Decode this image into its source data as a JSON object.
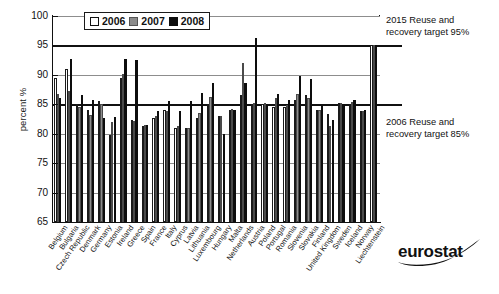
{
  "chart_data": {
    "type": "bar",
    "title": "",
    "xlabel": "",
    "ylabel": "percent %",
    "ylim": [
      65,
      100
    ],
    "yticks": [
      65,
      70,
      75,
      80,
      85,
      90,
      95,
      100
    ],
    "grid": true,
    "legend_position": "top-left-inside",
    "categories": [
      "Belgium",
      "Bulgaria",
      "Czech Republic",
      "Denmark",
      "Germany",
      "Estonia",
      "Ireland",
      "Greece",
      "Spain",
      "France",
      "Italy",
      "Cyprus",
      "Latvia",
      "Lithuania",
      "Luxembourg",
      "Hungary",
      "Malta",
      "Netherlands",
      "Austria",
      "Poland",
      "Portugal",
      "Romania",
      "Slovenia",
      "Slovakia",
      "Finland",
      "United Kingdom",
      "Sweden",
      "Iceland",
      "Norway",
      "Liechtenstein"
    ],
    "series": [
      {
        "name": "2006",
        "color": "#ffffff",
        "values": [
          89.5,
          91.0,
          85.0,
          84.0,
          85.5,
          79.7,
          89.5,
          82.3,
          81.3,
          82.7,
          84.0,
          81.0,
          80.9,
          82.7,
          85.0,
          83.0,
          84.0,
          86.5,
          85.0,
          85.0,
          84.5,
          84.5,
          85.8,
          86.5,
          84.0,
          83.3,
          85.3,
          85.0,
          83.8,
          95.0
        ]
      },
      {
        "name": "2007",
        "color": "#8c8c8c",
        "values": [
          86.7,
          87.2,
          84.5,
          83.2,
          85.0,
          82.0,
          90.2,
          82.2,
          81.5,
          83.0,
          83.8,
          81.3,
          81.0,
          83.5,
          86.3,
          83.0,
          84.2,
          92.0,
          85.2,
          85.3,
          86.0,
          84.8,
          86.7,
          86.0,
          84.0,
          81.3,
          85.2,
          85.4,
          83.9,
          95.0
        ]
      },
      {
        "name": "2008",
        "color": "#0d0d0d",
        "values": [
          86.0,
          92.7,
          86.5,
          85.8,
          82.7,
          82.8,
          92.7,
          92.6,
          81.4,
          83.9,
          85.5,
          83.8,
          85.5,
          87.0,
          88.7,
          80.0,
          84.0,
          88.7,
          96.2,
          85.0,
          86.8,
          85.8,
          89.8,
          89.3,
          84.7,
          82.4,
          85.0,
          85.7,
          84.0,
          95.0
        ]
      }
    ],
    "reference_lines": [
      {
        "value": 95,
        "label": "2015 Reuse and recovery target 95%"
      },
      {
        "value": 85,
        "label": "2006 Reuse and recovery target 85%"
      }
    ]
  },
  "legend": {
    "items": [
      {
        "label": "2006",
        "swatch": "white-square-icon"
      },
      {
        "label": "2007",
        "swatch": "gray-square-icon"
      },
      {
        "label": "2008",
        "swatch": "black-square-icon"
      }
    ]
  },
  "annotations": {
    "target_2015_line1": "2015 Reuse and",
    "target_2015_line2": "recovery target 95%",
    "target_2006_line1": "2006 Reuse and",
    "target_2006_line2": "recovery target 85%"
  },
  "branding": {
    "logo_text": "eurostat"
  }
}
